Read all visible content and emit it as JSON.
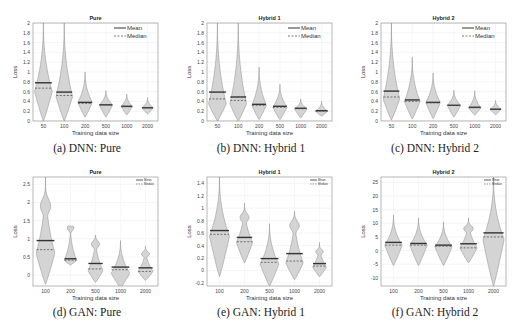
{
  "figure": {
    "legend": {
      "mean_label": "Mean",
      "median_label": "Median"
    },
    "ylabel": "Loss",
    "xlabel": "Training data size"
  },
  "chart_data": [
    {
      "id": "a",
      "type": "violin",
      "caption": "(a) DNN: Pure",
      "title": "Pure",
      "xlabel": "Training data size",
      "ylabel": "Loss",
      "ylim": [
        0,
        2
      ],
      "yticks": [
        0,
        0.2,
        0.4,
        0.6,
        0.8,
        1,
        1.2,
        1.4,
        1.6,
        1.8,
        2
      ],
      "ytick_labels": [
        "0",
        "0.2",
        "0.4",
        "0.6",
        "0.8",
        "1",
        "1.2",
        "1.4",
        "1.6",
        "1.8",
        "2"
      ],
      "grid": true,
      "legend_position": "upper right",
      "categories": [
        "50",
        "100",
        "200",
        "500",
        "1000",
        "2000"
      ],
      "series": [
        {
          "name": "Mean",
          "values": [
            0.78,
            0.59,
            0.38,
            0.33,
            0.3,
            0.27
          ]
        },
        {
          "name": "Median",
          "values": [
            0.67,
            0.52,
            0.36,
            0.33,
            0.29,
            0.27
          ]
        }
      ],
      "violins": [
        {
          "min": 0.0,
          "max": 2.0,
          "peak": 0.6,
          "halfwidth": 0.85
        },
        {
          "min": 0.0,
          "max": 2.0,
          "peak": 0.5,
          "halfwidth": 0.8
        },
        {
          "min": 0.08,
          "max": 1.0,
          "peak": 0.38,
          "halfwidth": 0.7
        },
        {
          "min": 0.08,
          "max": 0.62,
          "peak": 0.33,
          "halfwidth": 0.65
        },
        {
          "min": 0.12,
          "max": 0.55,
          "peak": 0.3,
          "halfwidth": 0.55
        },
        {
          "min": 0.14,
          "max": 0.48,
          "peak": 0.27,
          "halfwidth": 0.55
        }
      ]
    },
    {
      "id": "b",
      "type": "violin",
      "caption": "(b) DNN: Hybrid 1",
      "title": "Hybrid 1",
      "xlabel": "Training data size",
      "ylabel": "Loss",
      "ylim": [
        0,
        2
      ],
      "yticks": [
        0,
        0.2,
        0.4,
        0.6,
        0.8,
        1,
        1.2,
        1.4,
        1.6,
        1.8,
        2
      ],
      "ytick_labels": [
        "0",
        "0.2",
        "0.4",
        "0.6",
        "0.8",
        "1",
        "1.2",
        "1.4",
        "1.6",
        "1.8",
        "2"
      ],
      "grid": true,
      "legend_position": "upper right",
      "categories": [
        "50",
        "100",
        "200",
        "500",
        "1000",
        "2000"
      ],
      "series": [
        {
          "name": "Mean",
          "values": [
            0.59,
            0.49,
            0.34,
            0.3,
            0.26,
            0.21
          ]
        },
        {
          "name": "Median",
          "values": [
            0.45,
            0.42,
            0.32,
            0.28,
            0.25,
            0.2
          ]
        }
      ],
      "violins": [
        {
          "min": 0.0,
          "max": 2.0,
          "peak": 0.35,
          "halfwidth": 0.85
        },
        {
          "min": 0.0,
          "max": 2.0,
          "peak": 0.35,
          "halfwidth": 0.8
        },
        {
          "min": 0.03,
          "max": 1.1,
          "peak": 0.32,
          "halfwidth": 0.7
        },
        {
          "min": 0.03,
          "max": 0.75,
          "peak": 0.28,
          "halfwidth": 0.7
        },
        {
          "min": 0.06,
          "max": 0.45,
          "peak": 0.25,
          "halfwidth": 0.6
        },
        {
          "min": 0.1,
          "max": 0.4,
          "peak": 0.2,
          "halfwidth": 0.6
        }
      ]
    },
    {
      "id": "c",
      "type": "violin",
      "caption": "(c) DNN: Hybrid 2",
      "title": "Hybrid 2",
      "xlabel": "Training data size",
      "ylabel": "Loss",
      "ylim": [
        0,
        2
      ],
      "yticks": [
        0,
        0.2,
        0.4,
        0.6,
        0.8,
        1,
        1.2,
        1.4,
        1.6,
        1.8,
        2
      ],
      "ytick_labels": [
        "0",
        "0.2",
        "0.4",
        "0.6",
        "0.8",
        "1",
        "1.2",
        "1.4",
        "1.6",
        "1.8",
        "2"
      ],
      "grid": true,
      "legend_position": "upper right",
      "categories": [
        "50",
        "100",
        "200",
        "500",
        "1000",
        "2000"
      ],
      "series": [
        {
          "name": "Mean",
          "values": [
            0.61,
            0.43,
            0.38,
            0.32,
            0.28,
            0.24
          ]
        },
        {
          "name": "Median",
          "values": [
            0.49,
            0.4,
            0.37,
            0.32,
            0.27,
            0.24
          ]
        }
      ],
      "violins": [
        {
          "min": 0.02,
          "max": 2.0,
          "peak": 0.45,
          "halfwidth": 0.8
        },
        {
          "min": 0.04,
          "max": 1.3,
          "peak": 0.4,
          "halfwidth": 0.75
        },
        {
          "min": 0.05,
          "max": 0.98,
          "peak": 0.38,
          "halfwidth": 0.7
        },
        {
          "min": 0.08,
          "max": 0.63,
          "peak": 0.32,
          "halfwidth": 0.65
        },
        {
          "min": 0.12,
          "max": 0.62,
          "peak": 0.27,
          "halfwidth": 0.6
        },
        {
          "min": 0.13,
          "max": 0.42,
          "peak": 0.24,
          "halfwidth": 0.55
        }
      ]
    },
    {
      "id": "d",
      "type": "violin",
      "caption": "(d) GAN: Pure",
      "title": "Pure",
      "xlabel": "Training data size",
      "ylabel": "Loss",
      "ylim": [
        -0.3,
        2.7
      ],
      "yticks": [
        0,
        0.5,
        1,
        1.5,
        2,
        2.5
      ],
      "ytick_labels": [
        "0",
        "0.5",
        "1",
        "1.5",
        "2",
        "2.5"
      ],
      "grid": true,
      "legend_position": "upper right",
      "categories": [
        "100",
        "200",
        "500",
        "1000",
        "2000"
      ],
      "series": [
        {
          "name": "Mean",
          "values": [
            0.95,
            0.45,
            0.32,
            0.22,
            0.2
          ]
        },
        {
          "name": "Median",
          "values": [
            0.7,
            0.41,
            0.17,
            0.15,
            0.1
          ]
        }
      ],
      "violins": [
        {
          "min": -0.25,
          "max": 2.7,
          "peak": 0.6,
          "halfwidth": 0.75,
          "lobe": 1.9
        },
        {
          "min": 0.28,
          "max": 1.35,
          "peak": 0.4,
          "halfwidth": 0.5,
          "lobe": 1.3
        },
        {
          "min": -0.2,
          "max": 1.1,
          "peak": 0.12,
          "halfwidth": 0.6,
          "lobe": 0.85
        },
        {
          "min": -0.35,
          "max": 0.95,
          "peak": 0.05,
          "halfwidth": 0.75
        },
        {
          "min": -0.15,
          "max": 0.8,
          "peak": 0.1,
          "halfwidth": 0.6,
          "lobe": 0.58
        }
      ]
    },
    {
      "id": "e",
      "type": "violin",
      "caption": "(e) GAN: Hybrid 1",
      "title": "Hybrid 1",
      "xlabel": "Training data size",
      "ylabel": "Loss",
      "ylim": [
        -0.25,
        1.5
      ],
      "yticks": [
        -0.2,
        0,
        0.2,
        0.4,
        0.6,
        0.8,
        1,
        1.2,
        1.4
      ],
      "ytick_labels": [
        "-0.2",
        "0",
        "0.2",
        "0.4",
        "0.6",
        "0.8",
        "1",
        "1.2",
        "1.4"
      ],
      "grid": true,
      "legend_position": "upper right",
      "categories": [
        "100",
        "200",
        "500",
        "1000",
        "2000"
      ],
      "series": [
        {
          "name": "Mean",
          "values": [
            0.64,
            0.53,
            0.19,
            0.27,
            0.11
          ]
        },
        {
          "name": "Median",
          "values": [
            0.58,
            0.46,
            0.13,
            0.15,
            0.07
          ]
        }
      ],
      "violins": [
        {
          "min": -0.1,
          "max": 1.5,
          "peak": 0.55,
          "halfwidth": 0.8
        },
        {
          "min": 0.12,
          "max": 1.08,
          "peak": 0.45,
          "halfwidth": 0.65,
          "lobe": 0.85
        },
        {
          "min": -0.25,
          "max": 0.75,
          "peak": 0.1,
          "halfwidth": 0.75
        },
        {
          "min": -0.15,
          "max": 0.95,
          "peak": 0.12,
          "halfwidth": 0.7,
          "lobe": 0.72
        },
        {
          "min": -0.1,
          "max": 0.45,
          "peak": 0.05,
          "halfwidth": 0.55,
          "lobe": 0.3
        }
      ]
    },
    {
      "id": "f",
      "type": "violin",
      "caption": "(f) GAN: Hybrid 2",
      "title": "Hybrid 2",
      "xlabel": "Training data size",
      "ylabel": "Loss",
      "ylim": [
        -13,
        27
      ],
      "yticks": [
        -10,
        -5,
        0,
        5,
        10,
        15,
        20,
        25
      ],
      "ytick_labels": [
        "-10",
        "-5",
        "0",
        "5",
        "10",
        "15",
        "20",
        "25"
      ],
      "grid": true,
      "legend_position": "upper right",
      "categories": [
        "100",
        "200",
        "500",
        "1000",
        "2000"
      ],
      "series": [
        {
          "name": "Mean",
          "values": [
            3.0,
            2.6,
            2.0,
            2.5,
            6.5
          ]
        },
        {
          "name": "Median",
          "values": [
            2.0,
            2.0,
            1.6,
            1.0,
            5.0
          ]
        }
      ],
      "violins": [
        {
          "min": -5.5,
          "max": 13,
          "peak": 2.0,
          "halfwidth": 0.7
        },
        {
          "min": -5.5,
          "max": 12,
          "peak": 2.0,
          "halfwidth": 0.7
        },
        {
          "min": -5.5,
          "max": 10.5,
          "peak": 1.5,
          "halfwidth": 0.7
        },
        {
          "min": -4.5,
          "max": 12,
          "peak": 1.0,
          "halfwidth": 0.7,
          "lobe": 8
        },
        {
          "min": -13,
          "max": 27,
          "peak": 4.0,
          "halfwidth": 0.85
        }
      ]
    }
  ]
}
